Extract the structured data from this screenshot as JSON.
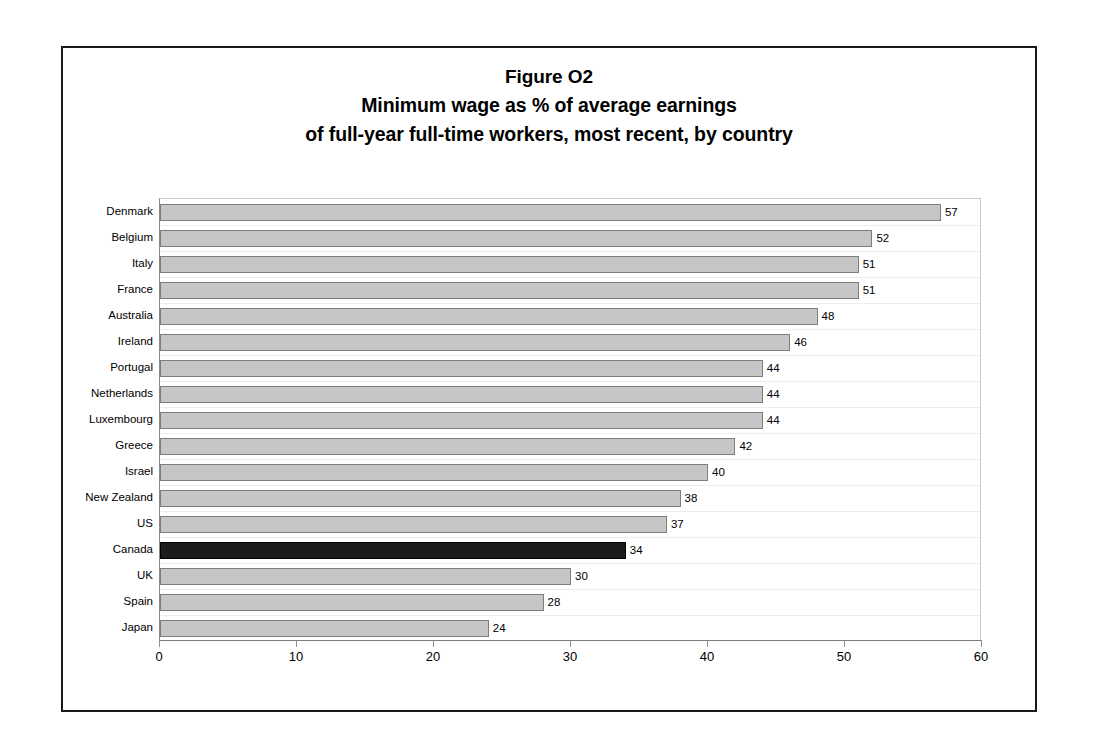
{
  "figure": {
    "title_lines": [
      "Figure O2",
      "Minimum wage as % of average earnings",
      "of full-year full-time workers, most recent, by country"
    ]
  },
  "chart_data": {
    "type": "bar",
    "orientation": "horizontal",
    "xlabel": "",
    "ylabel": "",
    "xlim": [
      0,
      60
    ],
    "xticks": [
      0,
      10,
      20,
      30,
      40,
      50,
      60
    ],
    "xtick_labels": [
      "0",
      "10",
      "20",
      "30",
      "40",
      "50",
      "60"
    ],
    "grid": false,
    "legend": "none",
    "highlight_category": "Canada",
    "colors": {
      "bar_fill": "#c6c6c6",
      "bar_border": "#7d7d7d",
      "highlight_fill": "#1b1b1b",
      "highlight_border": "#000000",
      "frame": "#1a1a1a",
      "text": "#000000"
    },
    "categories": [
      "Denmark",
      "Belgium",
      "Italy",
      "France",
      "Australia",
      "Ireland",
      "Portugal",
      "Netherlands",
      "Luxembourg",
      "Greece",
      "Israel",
      "New Zealand",
      "US",
      "Canada",
      "UK",
      "Spain",
      "Japan"
    ],
    "values": [
      57,
      52,
      51,
      51,
      48,
      46,
      44,
      44,
      44,
      42,
      40,
      38,
      37,
      34,
      30,
      28,
      24
    ],
    "value_labels": [
      "57",
      "52",
      "51",
      "51",
      "48",
      "46",
      "44",
      "44",
      "44",
      "42",
      "40",
      "38",
      "37",
      "34",
      "30",
      "28",
      "24"
    ]
  }
}
